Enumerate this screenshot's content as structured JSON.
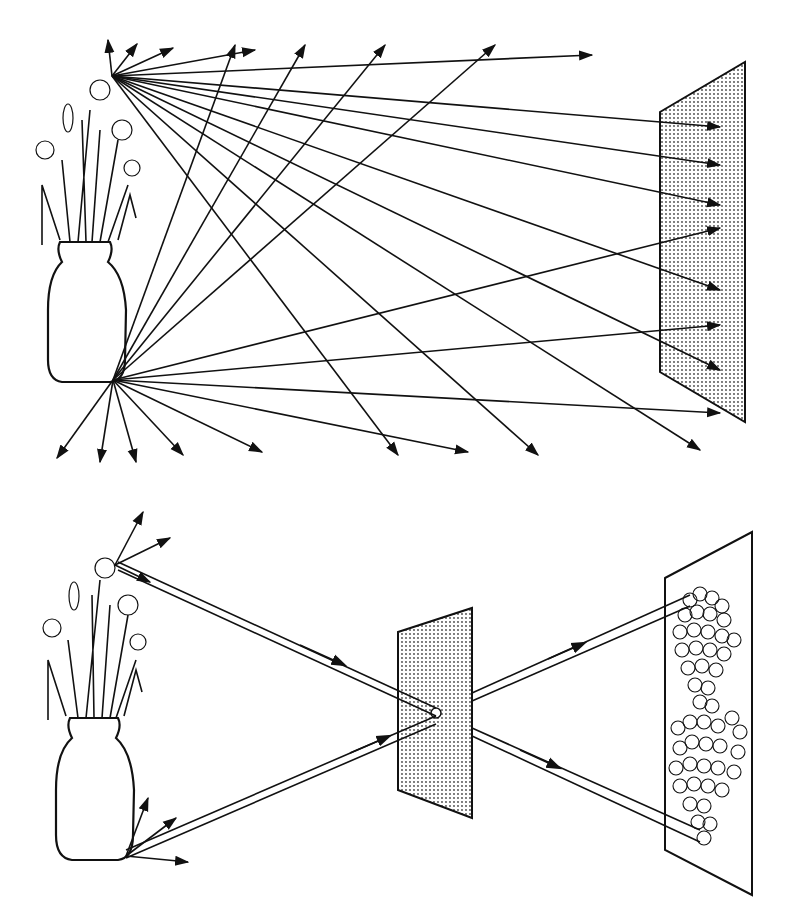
{
  "diagram": {
    "panels": [
      {
        "id": "top",
        "description": "Light rays scattered in all directions from points on a vase of daffodils reach every point of a screen, producing no image",
        "object": "vase-with-daffodils",
        "receiver": "screen-uniformly-lit",
        "colors": {
          "ink": "#111111",
          "screen_dots": "#444444",
          "background": "#ffffff"
        }
      },
      {
        "id": "bottom",
        "description": "A pinhole in an opaque barrier admits only narrow bundles of rays, projecting an inverted image of the flowers onto the screen",
        "object": "vase-with-daffodils",
        "barrier": "opaque-plate-with-pinhole",
        "receiver": "screen-with-inverted-blurred-image",
        "colors": {
          "ink": "#111111",
          "barrier_dots": "#444444",
          "background": "#ffffff"
        }
      }
    ]
  }
}
